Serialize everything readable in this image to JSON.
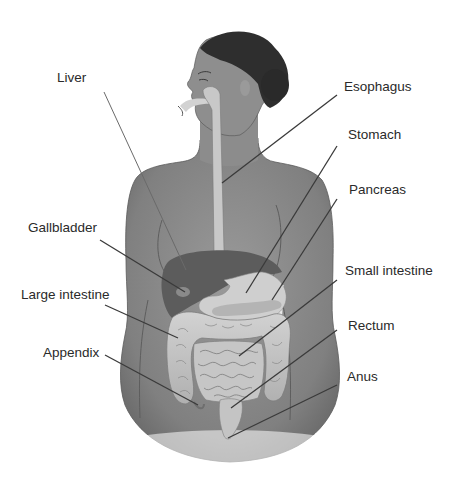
{
  "diagram": {
    "type": "anatomical illustration",
    "labels": [
      {
        "id": "liver",
        "text": "Liver",
        "x": 57,
        "y": 71,
        "line": [
          104,
          92,
          186,
          270
        ]
      },
      {
        "id": "gallbladder",
        "text": "Gallbladder",
        "x": 28,
        "y": 221,
        "line": [
          100,
          240,
          185,
          292
        ]
      },
      {
        "id": "large-intestine",
        "text": "Large intestine",
        "x": 21,
        "y": 288,
        "line": [
          105,
          305,
          178,
          338
        ]
      },
      {
        "id": "appendix",
        "text": "Appendix",
        "x": 43,
        "y": 346,
        "line": [
          105,
          355,
          198,
          405
        ]
      },
      {
        "id": "esophagus",
        "text": "Esophagus",
        "x": 344,
        "y": 80,
        "line": [
          337,
          95,
          222,
          183
        ]
      },
      {
        "id": "stomach",
        "text": "Stomach",
        "x": 348,
        "y": 128,
        "line": [
          337,
          146,
          246,
          293
        ]
      },
      {
        "id": "pancreas",
        "text": "Pancreas",
        "x": 349,
        "y": 183,
        "line": [
          337,
          199,
          272,
          300
        ]
      },
      {
        "id": "small-intestine",
        "text": "Small intestine",
        "x": 345,
        "y": 264,
        "line": [
          337,
          280,
          239,
          356
        ]
      },
      {
        "id": "rectum",
        "text": "Rectum",
        "x": 348,
        "y": 319,
        "line": [
          337,
          330,
          231,
          408
        ]
      },
      {
        "id": "anus",
        "text": "Anus",
        "x": 347,
        "y": 370,
        "line": [
          337,
          385,
          228,
          438
        ]
      }
    ],
    "colors": {
      "background": "#ffffff",
      "skin": "#8a8a8a",
      "skin_light": "#9c9c9c",
      "hair": "#2e2e2e",
      "liver": "#5e5e5e",
      "organ_light": "#c9c9c9",
      "intestine": "#bdbdbd",
      "leader_line": "#3a3a3a",
      "label_text": "#2a2a2a"
    }
  }
}
